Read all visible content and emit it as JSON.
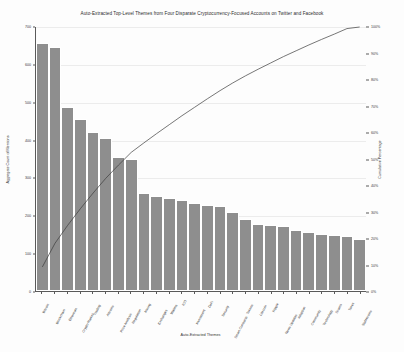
{
  "chart_data": {
    "type": "bar",
    "title": "Auto-Extracted Top-Level Themes from Four Disparate Cryptocurrency-Focused Accounts on Twitter and Facebook",
    "xlabel": "Auto-Extracted Themes",
    "ylabel": "Aggregate Count of Mentions",
    "y2label": "Cumulative Percentage",
    "ylim": [
      0,
      700
    ],
    "y2lim": [
      0,
      100
    ],
    "grid": true,
    "legend": "none",
    "bar_color": "#8e8e8e",
    "line_color": "#3c3c3c",
    "categories": [
      "Bitcoin",
      "Blockchain",
      "Ethereum",
      "Crypto Market",
      "Trading",
      "Altcoins",
      "Price Analysis",
      "Regulation",
      "Mining",
      "Exchanges",
      "Wallets",
      "ICO",
      "Investment",
      "DeFi",
      "Security",
      "Smart Contracts",
      "Tokens",
      "Litecoin",
      "Ripple",
      "News Updates",
      "Adoption",
      "Community",
      "Technology",
      "Scams",
      "Taxes",
      "Stablecoins"
    ],
    "values": [
      655,
      645,
      487,
      455,
      420,
      405,
      355,
      350,
      258,
      250,
      245,
      240,
      232,
      228,
      225,
      210,
      190,
      178,
      175,
      172,
      160,
      155,
      150,
      148,
      145,
      138
    ],
    "cumulative_percent": [
      9.1,
      18.1,
      24.9,
      31.2,
      37.1,
      42.7,
      47.7,
      52.5,
      56.1,
      59.6,
      63.0,
      66.4,
      69.6,
      72.8,
      75.9,
      78.8,
      81.5,
      84.0,
      86.4,
      88.8,
      91.0,
      93.2,
      95.3,
      97.3,
      99.4,
      100.0
    ],
    "y_ticks": [
      "0",
      "100",
      "200",
      "300",
      "400",
      "500",
      "600",
      "700"
    ],
    "y_tick_values": [
      0,
      100,
      200,
      300,
      400,
      500,
      600,
      700
    ],
    "y2_ticks": [
      "0%",
      "10%",
      "20%",
      "30%",
      "40%",
      "50%",
      "60%",
      "70%",
      "80%",
      "90%",
      "100%"
    ],
    "y2_tick_values": [
      0,
      10,
      20,
      30,
      40,
      50,
      60,
      70,
      80,
      90,
      100
    ]
  }
}
